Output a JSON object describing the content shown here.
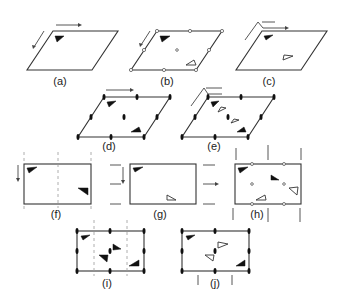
{
  "figure": {
    "panels": [
      {
        "id": "a",
        "label": "(a)",
        "shape": "parallelogram",
        "description": "oblique cell, translation arrows, one filled motif"
      },
      {
        "id": "b",
        "label": "(b)",
        "shape": "parallelogram",
        "description": "2-fold rotation centers (open circles), filled + open motif"
      },
      {
        "id": "c",
        "label": "(c)",
        "shape": "parallelogram",
        "description": "bent arrow symbol, filled + open motif"
      },
      {
        "id": "d",
        "label": "(d)",
        "shape": "parallelogram",
        "description": "2-fold axes (lens symbols), two filled motifs"
      },
      {
        "id": "e",
        "label": "(e)",
        "shape": "parallelogram",
        "description": "bent arrow + 2-fold axes, alternating filled/open motifs"
      },
      {
        "id": "f",
        "label": "(f)",
        "shape": "rectangle",
        "description": "rectangular cell, dashed glide lines, two filled motifs"
      },
      {
        "id": "g",
        "label": "(g)",
        "shape": "rectangle",
        "description": "rectangular cell, horizontal arrows, filled + open motif"
      },
      {
        "id": "h",
        "label": "(h)",
        "shape": "rectangle",
        "description": "rectangular cell with open circle centers, vertical arrows, four motifs"
      },
      {
        "id": "i",
        "label": "(i)",
        "shape": "rectangle",
        "description": "rectangular cell with 2-fold axes and dashed lines, four filled motifs"
      },
      {
        "id": "j",
        "label": "(j)",
        "shape": "rectangle",
        "description": "rectangular cell with 2-fold axes and arrows, filled + open motifs"
      }
    ]
  },
  "colors": {
    "line": "#333333",
    "motif_filled": "#111111",
    "background": "#ffffff"
  }
}
